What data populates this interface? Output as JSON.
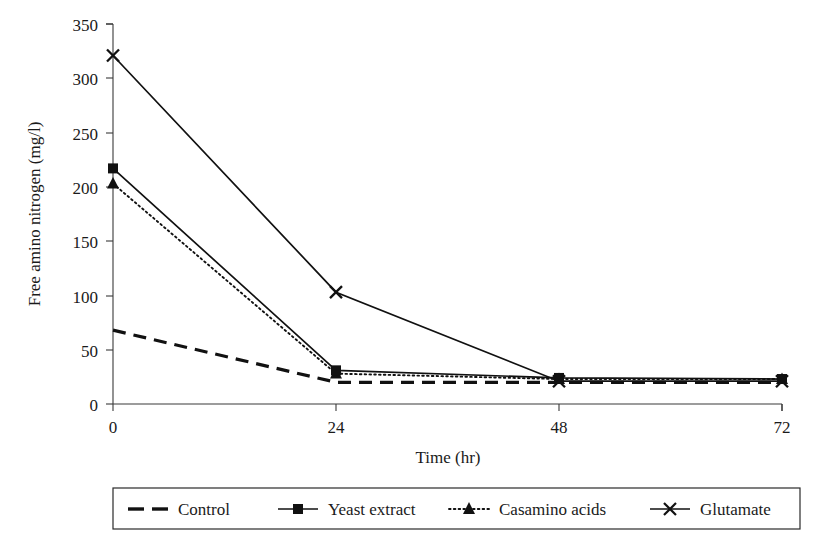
{
  "chart_data": {
    "type": "line",
    "title": "",
    "xlabel": "Time (hr)",
    "ylabel": "Free amino nitrogen (mg/l)",
    "x": [
      0,
      24,
      48,
      72
    ],
    "xticklabels": [
      "0",
      "24",
      "48",
      "72"
    ],
    "yticklabels": [
      "0",
      "50",
      "100",
      "150",
      "200",
      "250",
      "300",
      "350"
    ],
    "yticks": [
      0,
      50,
      100,
      150,
      200,
      250,
      300,
      350
    ],
    "xlim": [
      0,
      72
    ],
    "ylim": [
      0,
      350
    ],
    "grid": false,
    "legend_position": "bottom-outside",
    "series": [
      {
        "name": "Control",
        "values": [
          68,
          20,
          20,
          20
        ],
        "style": "dashed",
        "marker": "none",
        "color": "#111111"
      },
      {
        "name": "Yeast extract",
        "values": [
          217,
          31,
          24,
          23
        ],
        "style": "solid",
        "marker": "square",
        "color": "#111111"
      },
      {
        "name": "Casamino acids",
        "values": [
          203,
          28,
          23,
          23
        ],
        "style": "dotted",
        "marker": "triangle",
        "color": "#111111"
      },
      {
        "name": "Glutamate",
        "values": [
          321,
          103,
          21,
          21
        ],
        "style": "solid",
        "marker": "x",
        "color": "#111111"
      }
    ]
  },
  "axes": {
    "y_title": "Free amino nitrogen (mg/l)",
    "x_title": "Time (hr)",
    "y_ticks": [
      {
        "label": "350"
      },
      {
        "label": "300"
      },
      {
        "label": "250"
      },
      {
        "label": "200"
      },
      {
        "label": "150"
      },
      {
        "label": "100"
      },
      {
        "label": "50"
      },
      {
        "label": "0"
      }
    ],
    "x_ticks": [
      {
        "label": "0"
      },
      {
        "label": "24"
      },
      {
        "label": "48"
      },
      {
        "label": "72"
      }
    ]
  },
  "legend": {
    "entries": [
      {
        "label": "Control",
        "marker": "none-marker",
        "dash": "dashed"
      },
      {
        "label": "Yeast extract",
        "marker": "square-marker",
        "dash": "solid"
      },
      {
        "label": "Casamino acids",
        "marker": "triangle-marker",
        "dash": "dotted"
      },
      {
        "label": "Glutamate",
        "marker": "x-marker",
        "dash": "solid"
      }
    ]
  },
  "colors": {
    "ink": "#111111",
    "axis": "#3a3a3a",
    "background": "#ffffff"
  }
}
